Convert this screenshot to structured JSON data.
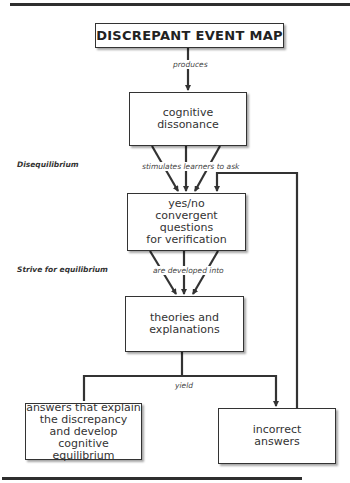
{
  "title": "DISCREPANT EVENT MAP",
  "nodes": {
    "dissonance": "cognitive\ndissonance",
    "questions": "yes/no\nconvergent questions\nfor verification",
    "theories": "theories and\nexplanations",
    "correct": "answers that explain\nthe discrepancy\nand develop cognitive\nequilibrium",
    "incorrect": "incorrect\nanswers"
  },
  "edges": {
    "produces": "produces",
    "stimulates": "stimulates learners to ask",
    "developed": "are developed into",
    "yield": "yield"
  },
  "side_labels": {
    "disequilibrium": "Disequilibrium",
    "strive": "Strive for equilibrium"
  },
  "colors": {
    "line": "#333333",
    "background": "#ffffff"
  }
}
